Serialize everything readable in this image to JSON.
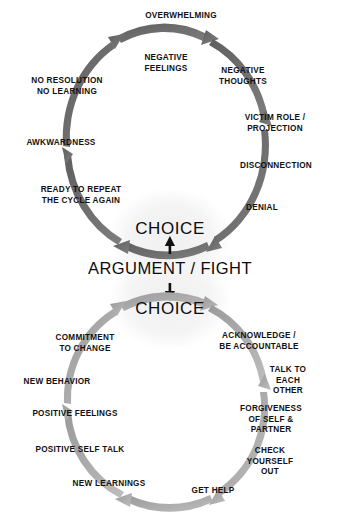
{
  "diagram": {
    "colors": {
      "arc_dark": "#6b6b6b",
      "arc_light": "#a9a9a9",
      "text": "#111111",
      "background": "#ffffff",
      "glow": "#f2f2f2"
    },
    "center": {
      "top_choice": "CHOICE",
      "argument": "ARGUMENT / FIGHT",
      "bottom_choice": "CHOICE",
      "up_arrow_icon": "arrow-up-icon",
      "down_arrow_icon": "arrow-down-icon"
    },
    "top_cycle": {
      "name": "negative-cycle",
      "labels": [
        {
          "text": "OVERWHELMING",
          "x": 181,
          "y": 16,
          "align": "center"
        },
        {
          "text": "NEGATIVE\nFEELINGS",
          "x": 166,
          "y": 63,
          "align": "center"
        },
        {
          "text": "NEGATIVE\nTHOUGHTS",
          "x": 243,
          "y": 76,
          "align": "center"
        },
        {
          "text": "VICTIM ROLE /\nPROJECTION",
          "x": 275,
          "y": 123,
          "align": "center"
        },
        {
          "text": "DISCONNECTION",
          "x": 276,
          "y": 166,
          "align": "center"
        },
        {
          "text": "DENIAL",
          "x": 262,
          "y": 208,
          "align": "center"
        },
        {
          "text": "READY TO REPEAT\nTHE CYCLE AGAIN",
          "x": 81,
          "y": 195,
          "align": "center"
        },
        {
          "text": "AWKWARDNESS",
          "x": 61,
          "y": 143,
          "align": "center"
        },
        {
          "text": "NO RESOLUTION\nNO LEARNING",
          "x": 67,
          "y": 86,
          "align": "center"
        }
      ]
    },
    "bottom_cycle": {
      "name": "positive-cycle",
      "labels": [
        {
          "text": "ACKNOWLEDGE /\nBE ACCOUNTABLE",
          "x": 259,
          "y": 341,
          "align": "center"
        },
        {
          "text": "TALK TO\nEACH OTHER",
          "x": 288,
          "y": 381,
          "align": "center"
        },
        {
          "text": "FORGIVENESS\nOF SELF & PARTNER",
          "x": 271,
          "y": 420,
          "align": "center"
        },
        {
          "text": "CHECK YOURSELF\nOUT",
          "x": 270,
          "y": 462,
          "align": "center"
        },
        {
          "text": "GET HELP",
          "x": 213,
          "y": 491,
          "align": "center"
        },
        {
          "text": "NEW LEARNINGS",
          "x": 109,
          "y": 484,
          "align": "center"
        },
        {
          "text": "POSITIVE SELF TALK",
          "x": 80,
          "y": 450,
          "align": "center"
        },
        {
          "text": "POSITIVE FEELINGS",
          "x": 75,
          "y": 414,
          "align": "center"
        },
        {
          "text": "NEW BEHAVIOR",
          "x": 57,
          "y": 382,
          "align": "center"
        },
        {
          "text": "COMMITMENT\nTO CHANGE",
          "x": 85,
          "y": 343,
          "align": "center"
        }
      ]
    }
  }
}
